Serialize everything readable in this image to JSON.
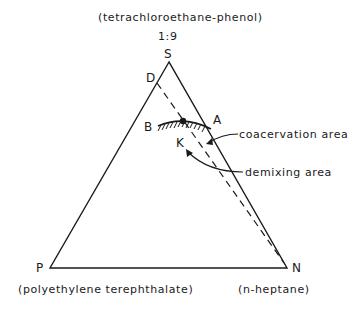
{
  "title": {
    "top_component": "(tetrachloroethane-phenol)",
    "ratio": "1:9"
  },
  "vertices": {
    "S": "S",
    "P": "P",
    "N": "N",
    "D": "D",
    "A": "A",
    "B": "B",
    "K": "K"
  },
  "components": {
    "P_name": "(polyethylene terephthalate)",
    "N_name": "(n-heptane)"
  },
  "annotations": {
    "coacervation": "coacervation area",
    "demixing": "demixing area"
  },
  "colors": {
    "ink": "#1a1a1a",
    "background": "#ffffff"
  }
}
